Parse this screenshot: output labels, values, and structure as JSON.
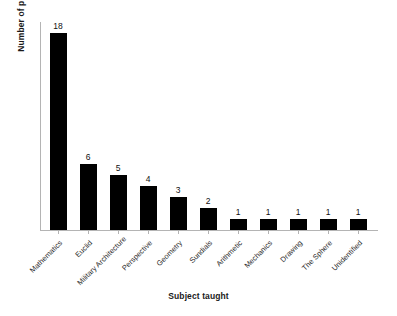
{
  "chart_data": {
    "type": "bar",
    "title": "",
    "xlabel": "Subject taught",
    "ylabel": "Number of pupils",
    "categories": [
      "Mathematics",
      "Euclid",
      "Military Architecture",
      "Perspective",
      "Geometry",
      "Sundials",
      "Arithmetic",
      "Mechanics",
      "Drawing",
      "The Sphere",
      "Unidentified"
    ],
    "values": [
      18,
      6,
      5,
      4,
      3,
      2,
      1,
      1,
      1,
      1,
      1
    ],
    "value_labels": [
      "18",
      "6",
      "5",
      "4",
      "3",
      "2",
      "1",
      "1",
      "1",
      "1",
      "1"
    ],
    "ylim": [
      0,
      19
    ],
    "grid": false,
    "legend": false,
    "bar_color": "#000000",
    "axis_color": "#b4b4b4",
    "background": "#ffffff"
  }
}
